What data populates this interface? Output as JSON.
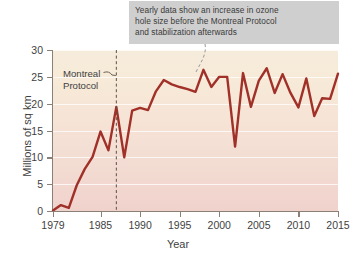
{
  "callout": {
    "lines": [
      "Yearly data show an increase in ozone",
      "hole size before the Montreal Protocol",
      "and stabilization afterwards"
    ],
    "bg_color": "#cfcfcf",
    "text_color": "#3a3a3a"
  },
  "annotation": {
    "label_lines": [
      "Montreal",
      "Protocol"
    ],
    "marker_year": 1987,
    "style": "dashed-vertical-line"
  },
  "chart_data": {
    "type": "line",
    "title": "",
    "xlabel": "Year",
    "ylabel": "Millions of sq km",
    "xlim": [
      1979,
      2015
    ],
    "ylim": [
      0,
      30
    ],
    "xticks": [
      1979,
      1985,
      1990,
      1995,
      2000,
      2005,
      2010,
      2015
    ],
    "yticks": [
      0,
      5,
      10,
      15,
      20,
      25,
      30
    ],
    "grid": "horizontal",
    "legend": "none",
    "line_color": "#a03028",
    "series": [
      {
        "name": "Ozone hole area",
        "x": [
          1979,
          1980,
          1981,
          1982,
          1983,
          1984,
          1985,
          1986,
          1987,
          1988,
          1989,
          1990,
          1991,
          1992,
          1993,
          1994,
          1995,
          1996,
          1997,
          1998,
          1999,
          2000,
          2001,
          2002,
          2003,
          2004,
          2005,
          2006,
          2007,
          2008,
          2009,
          2010,
          2011,
          2012,
          2013,
          2014,
          2015
        ],
        "values": [
          0.1,
          1.1,
          0.6,
          4.8,
          7.8,
          10.1,
          14.8,
          11.3,
          19.4,
          10.0,
          18.7,
          19.2,
          18.8,
          22.3,
          24.4,
          23.6,
          23.1,
          22.7,
          22.2,
          26.3,
          23.1,
          25.0,
          25.0,
          12.0,
          25.7,
          19.4,
          24.3,
          26.6,
          22.0,
          25.5,
          22.0,
          19.3,
          24.7,
          17.7,
          21.0,
          20.9,
          25.6
        ]
      }
    ]
  }
}
